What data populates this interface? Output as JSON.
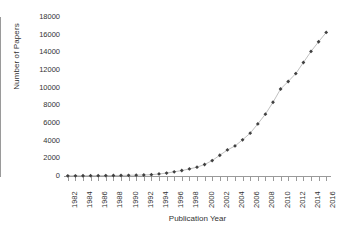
{
  "chart_data": {
    "type": "line",
    "title": "",
    "xlabel": "Publication Year",
    "ylabel": "Number of Papers",
    "grid": false,
    "legend": false,
    "xlim": [
      1981.5,
      2016.5
    ],
    "ylim": [
      0,
      18000
    ],
    "ytick_labels": [
      "18000",
      "16000",
      "14000",
      "12000",
      "10000",
      "8000",
      "6000",
      "4000",
      "2000",
      "0"
    ],
    "ytick_values": [
      18000,
      16000,
      14000,
      12000,
      10000,
      8000,
      6000,
      4000,
      2000,
      0
    ],
    "xtick_labels": [
      "1982",
      "1984",
      "1986",
      "1988",
      "1990",
      "1992",
      "1994",
      "1996",
      "1998",
      "2000",
      "2002",
      "2004",
      "2006",
      "2008",
      "2010",
      "2012",
      "2014",
      "2016"
    ],
    "xtick_values": [
      1982,
      1984,
      1986,
      1988,
      1990,
      1992,
      1994,
      1996,
      1998,
      2000,
      2002,
      2004,
      2006,
      2008,
      2010,
      2012,
      2014,
      2016
    ],
    "x": [
      1982,
      1983,
      1984,
      1985,
      1986,
      1987,
      1988,
      1989,
      1990,
      1991,
      1992,
      1993,
      1994,
      1995,
      1996,
      1997,
      1998,
      1999,
      2000,
      2001,
      2002,
      2003,
      2004,
      2005,
      2006,
      2007,
      2008,
      2009,
      2010,
      2011,
      2012,
      2013,
      2014,
      2015,
      2016
    ],
    "values": [
      20,
      25,
      30,
      35,
      40,
      45,
      55,
      65,
      80,
      95,
      115,
      150,
      230,
      330,
      470,
      620,
      800,
      1000,
      1300,
      1750,
      2350,
      2950,
      3400,
      4100,
      4850,
      5900,
      7000,
      8350,
      9850,
      10700,
      11600,
      12850,
      14100,
      15200,
      16250
    ],
    "series": [
      {
        "name": "Number of Papers",
        "marker": "diamond",
        "marker_color": "#404040",
        "line_color": "#b0b0b0",
        "values": [
          20,
          25,
          30,
          35,
          40,
          45,
          55,
          65,
          80,
          95,
          115,
          150,
          230,
          330,
          470,
          620,
          800,
          1000,
          1300,
          1750,
          2350,
          2950,
          3400,
          4100,
          4850,
          5900,
          7000,
          8350,
          9850,
          10700,
          11600,
          12850,
          14100,
          15200,
          16250
        ]
      }
    ],
    "axis_color": "#9a9a9a",
    "text_color": "#333333",
    "background": "#ffffff"
  }
}
